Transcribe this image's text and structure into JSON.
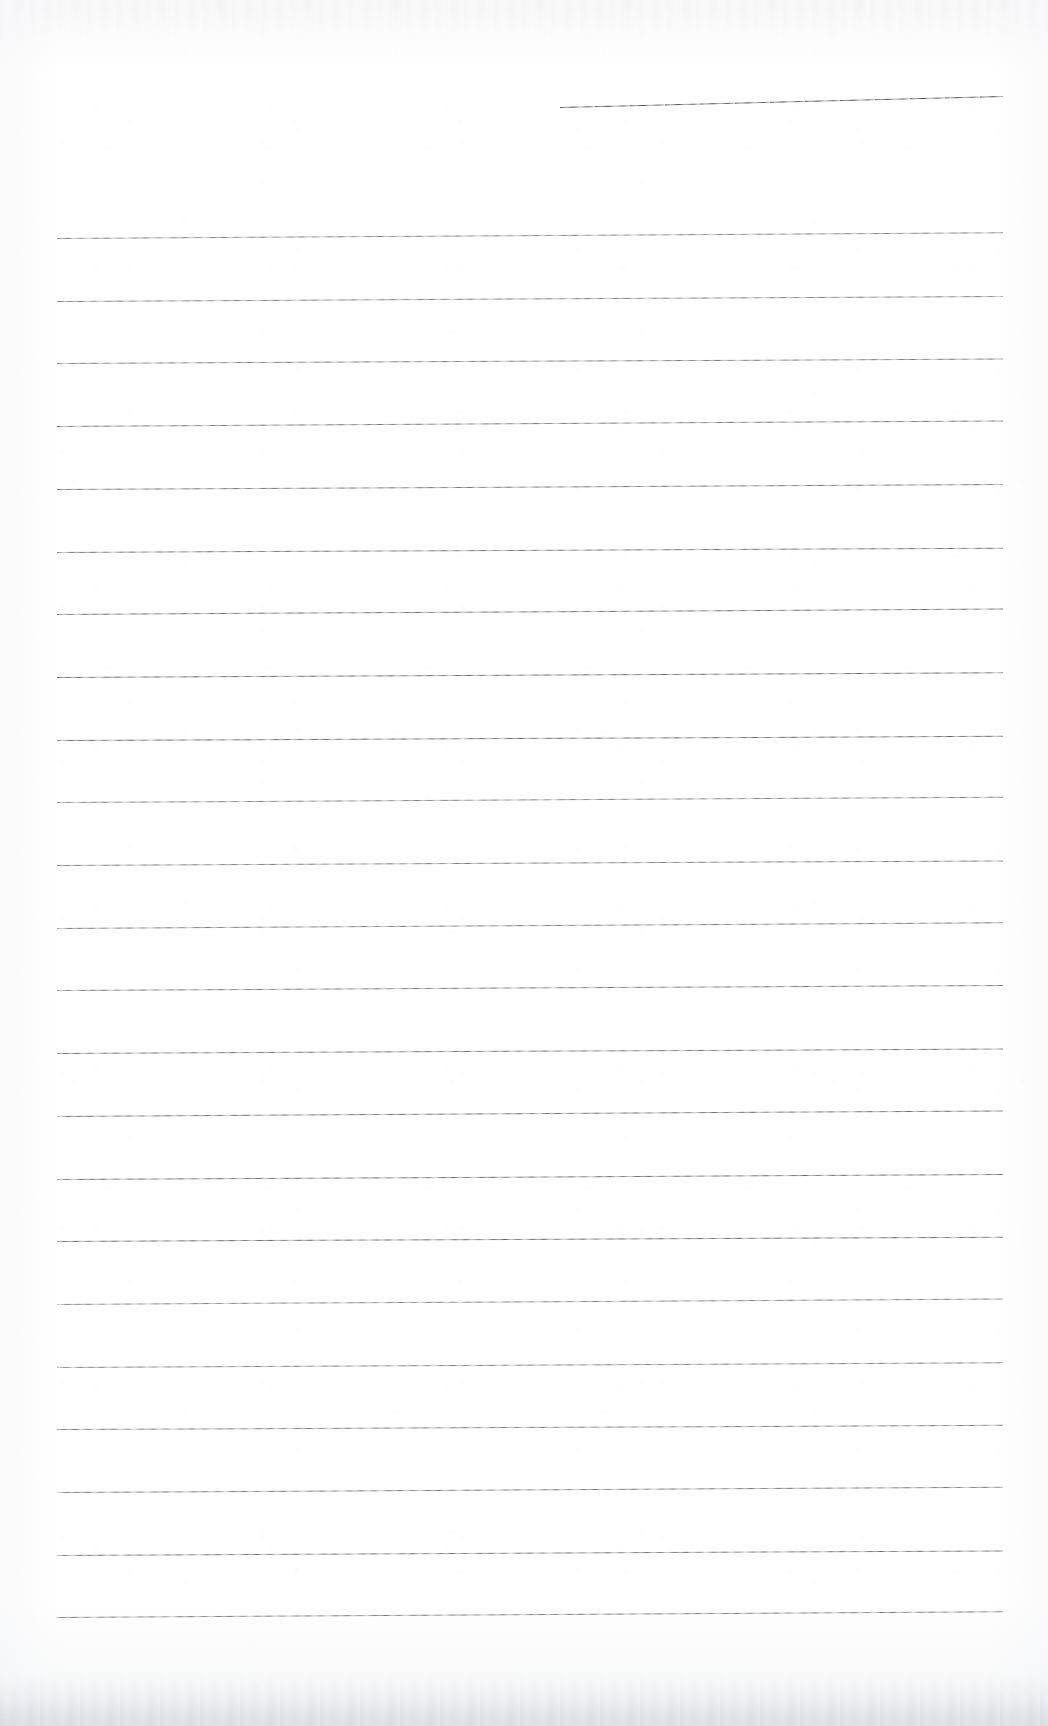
{
  "document": {
    "kind": "scanned-lined-notepaper",
    "page_width": 1048,
    "page_height": 1726,
    "background_color": "#ffffff",
    "ink_color": "#4a4c52",
    "edge_smudge_color": "#c6c8cd",
    "visible_text": "",
    "handwriting_present": false,
    "header_rule": {
      "label": "header-rule",
      "x": 560,
      "y_left": 107,
      "y_right": 96,
      "width": 443,
      "thickness": 1,
      "tilt_degrees": -1.42
    },
    "body_rules": {
      "label": "body-rules",
      "count": 23,
      "x": 57,
      "width": 946,
      "first_y": 238,
      "spacing": 62.7,
      "thickness": 1,
      "tilt_degrees": -0.3,
      "y_positions": [
        238.0,
        300.7,
        363.4,
        426.1,
        488.8,
        551.5,
        614.2,
        676.9,
        739.6,
        802.3,
        865.0,
        927.7,
        990.4,
        1053.1,
        1115.8,
        1178.5,
        1241.2,
        1303.9,
        1366.6,
        1429.3,
        1492.0,
        1554.7,
        1617.4
      ]
    },
    "margins": {
      "top_blank_height": 238,
      "bottom_blank_height": 109,
      "left_margin": 57,
      "right_margin": 45
    }
  }
}
